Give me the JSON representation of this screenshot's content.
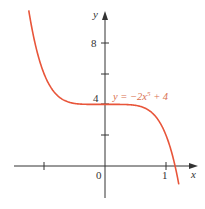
{
  "chart_data": {
    "type": "line",
    "title": "",
    "equation_label": "y = −2x⁵ + 4",
    "function": "-2*x^5 + 4",
    "xlabel": "x",
    "ylabel": "y",
    "x_ticks": [
      -1,
      0,
      1
    ],
    "x_tick_labels": [
      "",
      "0",
      "1"
    ],
    "y_ticks": [
      2,
      4,
      6,
      8
    ],
    "y_tick_labels": [
      "",
      "4",
      "",
      "8"
    ],
    "xlim": [
      -1.5,
      1.5
    ],
    "ylim": [
      -2,
      10
    ],
    "grid": false,
    "series": [
      {
        "name": "y = −2x⁵ + 4",
        "color": "#e8553a",
        "x": [
          -1.25,
          -1.1,
          -1.0,
          -0.8,
          -0.6,
          -0.4,
          -0.2,
          0,
          0.2,
          0.4,
          0.6,
          0.8,
          1.0,
          1.1,
          1.149,
          1.22
        ],
        "values": [
          10.1,
          7.22,
          6.0,
          4.66,
          4.16,
          4.02,
          4.0,
          4.0,
          4.0,
          3.98,
          3.84,
          3.34,
          2.0,
          0.78,
          0.0,
          -1.4
        ]
      }
    ]
  },
  "labels": {
    "x_axis": "x",
    "y_axis": "y",
    "origin": "0",
    "x_one": "1",
    "y_four": "4",
    "y_eight": "8",
    "equation_prefix": "y  =  −2x",
    "equation_exp": "5",
    "equation_suffix": " + 4"
  },
  "colors": {
    "curve": "#e8553a",
    "axis": "#333333",
    "equation": "#d9704f"
  }
}
